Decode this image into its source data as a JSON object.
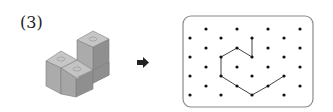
{
  "problem": {
    "label": "(3)"
  },
  "figure": {
    "type": "isometric-cube-stack",
    "cube_count": 4,
    "colors": {
      "top": "#c4c4c4",
      "left": "#a9a9a9",
      "right": "#8e8e8e",
      "edge": "#7a7a7a"
    }
  },
  "arrow": {
    "direction": "right",
    "color": "#222222"
  },
  "dot_grid": {
    "frame": {
      "x": 183,
      "y": 16,
      "width": 130,
      "height": 91,
      "radius": 8,
      "stroke": "#8a8a8a"
    },
    "dot_color": "#111111",
    "dots": [
      [
        206,
        29
      ],
      [
        237,
        29
      ],
      [
        268,
        29
      ],
      [
        300,
        29
      ],
      [
        190,
        38
      ],
      [
        221,
        38
      ],
      [
        252,
        38
      ],
      [
        284,
        38
      ],
      [
        206,
        48
      ],
      [
        237,
        48
      ],
      [
        268,
        48
      ],
      [
        300,
        48
      ],
      [
        190,
        57
      ],
      [
        221,
        57
      ],
      [
        252,
        57
      ],
      [
        284,
        57
      ],
      [
        206,
        67
      ],
      [
        237,
        67
      ],
      [
        268,
        67
      ],
      [
        300,
        67
      ],
      [
        190,
        76
      ],
      [
        221,
        76
      ],
      [
        252,
        76
      ],
      [
        284,
        76
      ],
      [
        206,
        86
      ],
      [
        237,
        86
      ],
      [
        268,
        86
      ],
      [
        300,
        86
      ],
      [
        190,
        95
      ],
      [
        221,
        95
      ],
      [
        252,
        95
      ],
      [
        284,
        95
      ]
    ],
    "path": [
      [
        252,
        38
      ],
      [
        252,
        57
      ],
      [
        237,
        48
      ],
      [
        221,
        57
      ],
      [
        221,
        76
      ],
      [
        237,
        86
      ],
      [
        252,
        95
      ],
      [
        268,
        86
      ],
      [
        284,
        76
      ]
    ],
    "path_color": "#444444"
  }
}
